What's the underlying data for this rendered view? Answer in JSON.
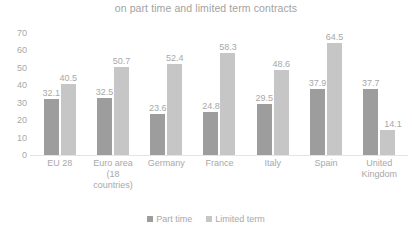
{
  "chart_data": {
    "type": "bar",
    "title": "on part time and limited term contracts",
    "xlabel": "",
    "ylabel": "",
    "ylim": [
      0,
      70
    ],
    "yticks": [
      70,
      60,
      50,
      40,
      30,
      20,
      10,
      0
    ],
    "grid": false,
    "legend_position": "bottom-center",
    "categories": [
      "EU 28",
      "Euro area (18 countries)",
      "Germany",
      "France",
      "Italy",
      "Spain",
      "United Kingdom"
    ],
    "series": [
      {
        "name": "Part time",
        "color": "#9d9d9d",
        "values": [
          32.1,
          32.5,
          23.6,
          24.8,
          29.5,
          37.9,
          37.7
        ]
      },
      {
        "name": "Limited term",
        "color": "#c6c6c6",
        "values": [
          40.5,
          50.7,
          52.4,
          58.3,
          48.6,
          64.5,
          14.1
        ]
      }
    ]
  },
  "colors": {
    "text": "#a8a8a8",
    "title": "#a2a2a2",
    "axis": "#e4e4e4",
    "series_part_time": "#9d9d9d",
    "series_limited_term": "#c6c6c6"
  }
}
